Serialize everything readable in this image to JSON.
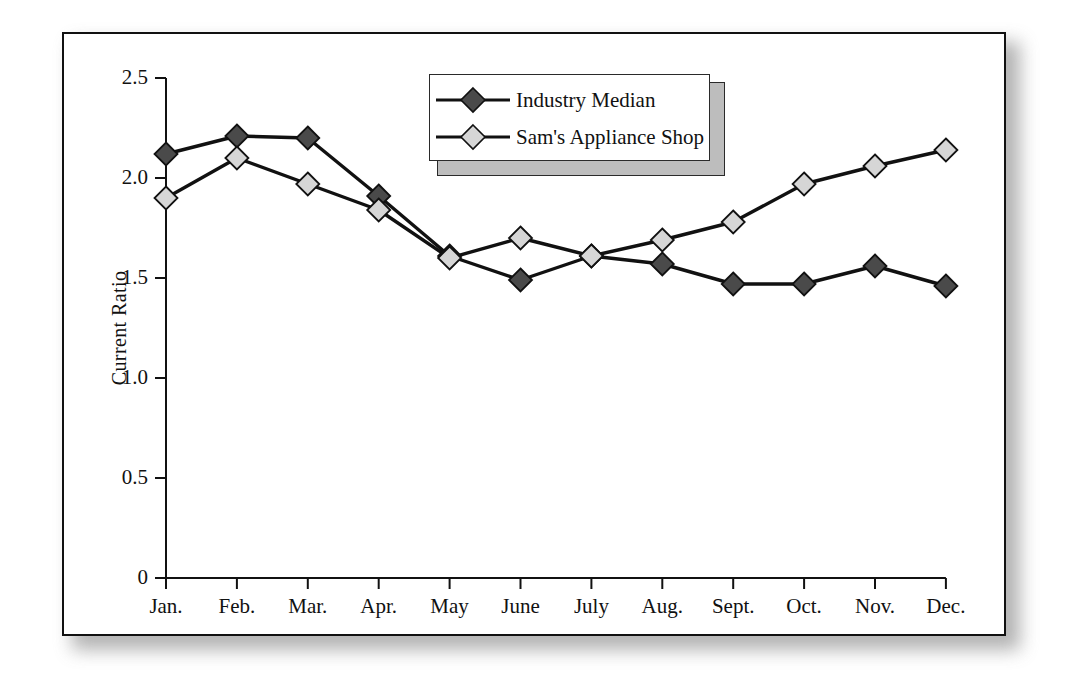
{
  "chart_data": {
    "type": "line",
    "title": "",
    "xlabel": "",
    "ylabel": "Current Ratio",
    "categories": [
      "Jan.",
      "Feb.",
      "Mar.",
      "Apr.",
      "May",
      "June",
      "July",
      "Aug.",
      "Sept.",
      "Oct.",
      "Nov.",
      "Dec."
    ],
    "ylim": [
      0,
      2.5
    ],
    "ytick_labels": [
      "0",
      "0.5",
      "1.0",
      "1.5",
      "2.0",
      "2.5"
    ],
    "ytick_values": [
      0,
      0.5,
      1.0,
      1.5,
      2.0,
      2.5
    ],
    "grid": false,
    "legend_position": "top-center",
    "series": [
      {
        "name": "Industry Median",
        "marker": "diamond",
        "color": "#4a4a4a",
        "line_color": "#111111",
        "values": [
          2.12,
          2.21,
          2.2,
          1.91,
          1.61,
          1.49,
          1.61,
          1.57,
          1.47,
          1.47,
          1.56,
          1.46
        ]
      },
      {
        "name": "Sam's Appliance Shop",
        "marker": "diamond",
        "color": "#d6d6d6",
        "line_color": "#111111",
        "values": [
          1.9,
          2.1,
          1.97,
          1.84,
          1.6,
          1.7,
          1.61,
          1.69,
          1.78,
          1.97,
          2.06,
          2.14
        ]
      }
    ]
  },
  "legend": {
    "entries": [
      {
        "label": "Industry Median"
      },
      {
        "label": "Sam's Appliance Shop"
      }
    ]
  }
}
